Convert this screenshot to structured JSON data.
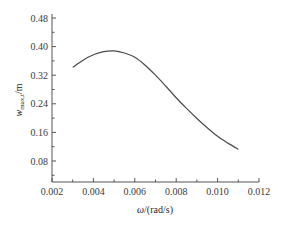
{
  "chart_data": {
    "type": "line",
    "title": "",
    "xlabel": "ω/(rad/s)",
    "xlabel_parts": {
      "symbol": "ω",
      "unit": "/(rad/s)"
    },
    "ylabel": "w_max,t/m",
    "ylabel_parts": {
      "symbol": "w",
      "subscript": "max,t",
      "unit": "/m"
    },
    "xlim": [
      0.002,
      0.012
    ],
    "ylim": [
      0.022,
      0.48
    ],
    "xticks": [
      0.002,
      0.004,
      0.006,
      0.008,
      0.01,
      0.012
    ],
    "xtick_labels": [
      "0.002",
      "0.004",
      "0.006",
      "0.008",
      "0.010",
      "0.012"
    ],
    "yticks": [
      0.08,
      0.16,
      0.24,
      0.32,
      0.4,
      0.48
    ],
    "ytick_labels": [
      "0.08",
      "0.16",
      "0.24",
      "0.32",
      "0.40",
      "0.48"
    ],
    "grid": false,
    "legend": null,
    "series": [
      {
        "name": "w_max,t",
        "x": [
          0.003,
          0.0035,
          0.004,
          0.0045,
          0.005,
          0.0055,
          0.006,
          0.0065,
          0.007,
          0.0075,
          0.008,
          0.0085,
          0.009,
          0.0095,
          0.01,
          0.0105,
          0.011
        ],
        "y": [
          0.342,
          0.362,
          0.377,
          0.386,
          0.388,
          0.382,
          0.37,
          0.348,
          0.32,
          0.289,
          0.257,
          0.227,
          0.199,
          0.173,
          0.149,
          0.13,
          0.113
        ]
      }
    ]
  }
}
